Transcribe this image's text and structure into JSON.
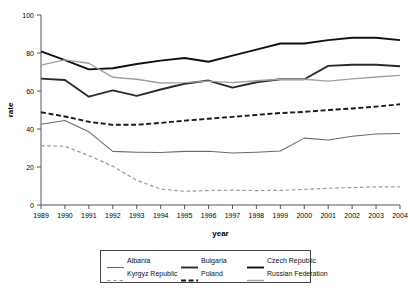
{
  "chart_data": {
    "type": "line",
    "title": "",
    "xlabel": "year",
    "ylabel": "rate",
    "x": [
      1989,
      1990,
      1991,
      1992,
      1993,
      1994,
      1995,
      1996,
      1997,
      1998,
      1999,
      2000,
      2001,
      2002,
      2003,
      2004
    ],
    "categories": [
      "1989",
      "1990",
      "1991",
      "1992",
      "1993",
      "1994",
      "1995",
      "1996",
      "1997",
      "1998",
      "1999",
      "2000",
      "2001",
      "2002",
      "2003",
      "2004"
    ],
    "xlim": [
      1989,
      2004
    ],
    "ylim": [
      0,
      100
    ],
    "yticks": [
      0,
      20,
      40,
      60,
      80,
      100
    ],
    "ytick_labels": [
      "0",
      "20",
      "40",
      "60",
      "80",
      "100"
    ],
    "grid": false,
    "legend_position": "bottom",
    "series": [
      {
        "name": "Albania",
        "color": "#6b6b6b",
        "style": "solid",
        "width": 1.1,
        "values": [
          42.5,
          44.5,
          38.5,
          28.2,
          27.8,
          27.6,
          28.2,
          28.3,
          27.4,
          27.8,
          28.4,
          35.2,
          34.2,
          36.2,
          37.4,
          37.6
        ]
      },
      {
        "name": "Bulgaria",
        "color": "#2c2c2c",
        "style": "solid",
        "width": 1.9,
        "values": [
          66.5,
          65.8,
          57.0,
          60.3,
          57.4,
          60.8,
          63.8,
          65.5,
          61.8,
          64.6,
          66.2,
          66.2,
          73.2,
          73.8,
          73.8,
          73.0
        ]
      },
      {
        "name": "Czech Republic",
        "color": "#111111",
        "style": "solid",
        "width": 1.9,
        "values": [
          80.9,
          76.3,
          71.4,
          72.0,
          74.2,
          76.0,
          77.4,
          75.4,
          78.6,
          81.8,
          85.0,
          85.0,
          86.8,
          88.0,
          88.0,
          86.8
        ]
      },
      {
        "name": "Kyrgyz Republic",
        "color": "#9a9a9a",
        "style": "dashed",
        "width": 1.2,
        "values": [
          31.2,
          30.9,
          26.0,
          20.4,
          13.0,
          8.4,
          7.2,
          7.6,
          7.8,
          7.6,
          7.7,
          8.2,
          8.8,
          9.2,
          9.5,
          9.6
        ]
      },
      {
        "name": "Poland",
        "color": "#1a1a1a",
        "style": "dashed",
        "width": 1.9,
        "values": [
          48.8,
          46.6,
          43.8,
          42.2,
          42.2,
          43.2,
          44.4,
          45.4,
          46.4,
          47.4,
          48.4,
          49.0,
          50.0,
          50.8,
          51.8,
          53.0
        ]
      },
      {
        "name": "Russian Federation",
        "color": "#a0a0a0",
        "style": "solid",
        "width": 1.4,
        "values": [
          73.6,
          76.4,
          74.6,
          67.2,
          66.2,
          64.2,
          64.4,
          65.2,
          64.4,
          65.4,
          66.2,
          66.2,
          65.2,
          66.4,
          67.4,
          68.2
        ]
      }
    ]
  },
  "legend": {
    "entries": [
      {
        "label": "Albania"
      },
      {
        "label": "Bulgaria"
      },
      {
        "label": "Czech Republic"
      },
      {
        "label": "Kyrgyz Republic"
      },
      {
        "label": "Poland"
      },
      {
        "label": "Russian Federation"
      }
    ]
  }
}
